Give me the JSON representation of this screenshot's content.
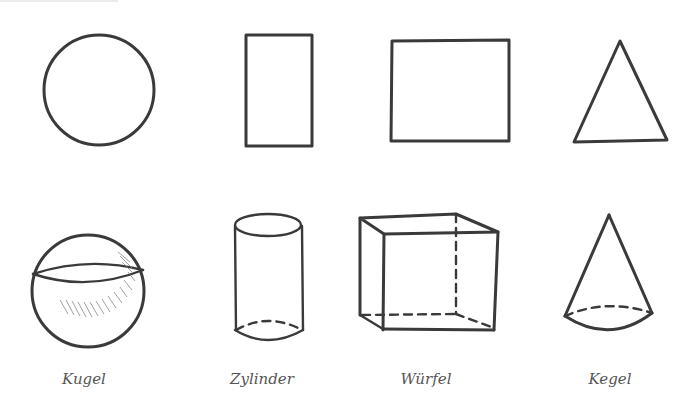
{
  "shapes_2d": [
    {
      "name": "circle"
    },
    {
      "name": "rectangle"
    },
    {
      "name": "square"
    },
    {
      "name": "triangle"
    }
  ],
  "shapes_3d": [
    {
      "name": "sphere",
      "label": "Kugel",
      "label_x": 84
    },
    {
      "name": "cylinder",
      "label": "Zylinder",
      "label_x": 262
    },
    {
      "name": "cube",
      "label": "Würfel",
      "label_x": 426
    },
    {
      "name": "cone",
      "label": "Kegel",
      "label_x": 610
    }
  ],
  "colors": {
    "stroke": "#3a3a3a",
    "label": "#555555",
    "background": "#ffffff"
  }
}
